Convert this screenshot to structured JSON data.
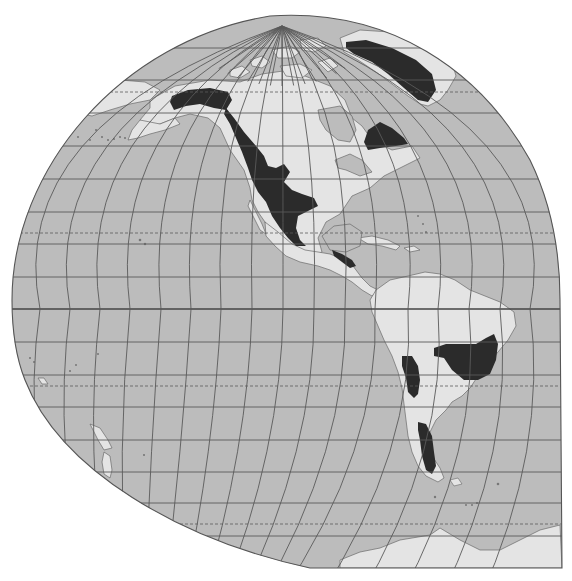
{
  "map": {
    "title": "",
    "projection": "interrupted-globular-western-hemisphere",
    "colors": {
      "background": "#ffffff",
      "ocean": "#bcbcbc",
      "land": "#e4e4e4",
      "highlight_region": "#2b2b2b",
      "grid": "#5a5a5a",
      "outline": "#555555"
    },
    "outline_path": "M 12 300 C 12 170 120 40 270 16 C 390 8 480 70 530 160 C 552 205 560 250 560 300 L 562 568 L 310 568 C 180 540 60 470 25 380 C 15 355 12 330 12 300 Z",
    "parallels": [
      {
        "y": 48,
        "style": "solid"
      },
      {
        "y": 80,
        "style": "solid"
      },
      {
        "y": 92,
        "style": "dashed",
        "label": "arctic-circle"
      },
      {
        "y": 113,
        "style": "solid"
      },
      {
        "y": 146,
        "style": "solid"
      },
      {
        "y": 179,
        "style": "solid"
      },
      {
        "y": 212,
        "style": "solid"
      },
      {
        "y": 233,
        "style": "dashed",
        "label": "tropic-of-cancer"
      },
      {
        "y": 244,
        "style": "solid"
      },
      {
        "y": 277,
        "style": "solid"
      },
      {
        "y": 309,
        "style": "equator"
      },
      {
        "y": 342,
        "style": "solid"
      },
      {
        "y": 375,
        "style": "solid"
      },
      {
        "y": 386,
        "style": "dashed",
        "label": "tropic-of-capricorn"
      },
      {
        "y": 407,
        "style": "solid"
      },
      {
        "y": 440,
        "style": "solid"
      },
      {
        "y": 472,
        "style": "solid"
      },
      {
        "y": 503,
        "style": "solid"
      },
      {
        "y": 524,
        "style": "dashed",
        "label": "antarctic-circle"
      },
      {
        "y": 536,
        "style": "solid"
      }
    ],
    "pole": {
      "x": 282,
      "y": 26
    },
    "south_convergence": {
      "x": 120,
      "y": 720
    },
    "meridian_equator_x": [
      40,
      70,
      100,
      130,
      161,
      191,
      221,
      252,
      283,
      314,
      345,
      375,
      408,
      438,
      469,
      500,
      530
    ],
    "land_shapes": [
      {
        "name": "north-america",
        "points": "150,100 175,86 210,80 240,82 262,74 290,70 310,78 330,86 345,100 352,118 362,126 372,140 392,150 412,146 420,158 400,168 384,176 370,188 352,196 340,214 326,222 318,238 322,252 310,258 298,252 288,246 278,240 270,232 265,222 258,212 252,200 250,188 244,170 230,150 220,128 208,118 190,114 175,118 160,124 148,126 140,120 150,108"
      },
      {
        "name": "alaska-peninsula",
        "points": "140,120 160,124 175,118 180,124 165,130 150,134 138,138 128,140 132,130"
      },
      {
        "name": "chukotka",
        "points": "100,84 120,80 145,82 160,90 150,100 130,104 110,110 92,116 82,114 90,100"
      },
      {
        "name": "central-america",
        "points": "265,222 278,232 292,244 305,250 318,252 330,254 340,258 350,262 356,270 362,278 370,286 378,290 372,296 362,290 352,282 342,276 330,270 318,266 300,262 286,256 275,246 266,236"
      },
      {
        "name": "baja-california",
        "points": "250,200 256,212 262,224 266,234 260,230 254,218 248,206"
      },
      {
        "name": "south-america",
        "points": "376,290 390,280 408,276 425,272 440,274 455,280 470,290 485,296 500,302 514,312 516,326 508,340 498,352 488,364 478,376 470,388 462,396 452,402 446,410 436,420 430,432 428,444 432,456 440,468 444,478 438,482 426,476 418,466 412,452 408,436 406,420 404,404 402,388 398,372 392,356 384,340 378,326 372,312 370,300"
      },
      {
        "name": "greenland",
        "points": "340,38 360,30 390,32 420,40 440,50 452,62 456,76 448,90 440,100 428,106 420,104 408,96 392,84 376,72 358,60 344,52"
      },
      {
        "name": "cuba",
        "points": "358,238 372,236 388,240 400,246 396,250 382,246 368,244"
      },
      {
        "name": "hispaniola",
        "points": "404,248 414,246 420,250 410,252"
      },
      {
        "name": "antarctica",
        "points": "340,560 360,552 380,548 400,540 430,535 440,528 460,540 480,550 500,550 520,540 540,530 560,525 562,568 340,568"
      },
      {
        "name": "new-zealand-north",
        "points": "90,424 100,428 108,440 112,448 104,450 98,440"
      },
      {
        "name": "new-zealand-south",
        "points": "104,452 110,456 112,470 110,478 104,474 102,462"
      },
      {
        "name": "fiji",
        "points": "38,378 44,378 48,384 42,384"
      }
    ],
    "arctic_islands": [
      {
        "points": "250,60 262,56 270,62 262,68 252,66"
      },
      {
        "points": "272,50 290,46 300,52 292,58 278,58"
      },
      {
        "points": "300,40 318,38 326,46 314,52 302,50"
      },
      {
        "points": "280,66 300,64 312,70 302,78 286,76"
      },
      {
        "points": "230,70 242,66 250,72 240,78 230,76"
      },
      {
        "points": "318,62 330,58 338,66 328,72"
      }
    ],
    "inland_water": [
      {
        "name": "hudson-bay",
        "points": "318,110 340,106 352,116 356,130 350,142 338,140 326,130 320,120"
      },
      {
        "name": "gulf-of-mexico",
        "points": "322,236 334,226 350,224 362,232 360,246 346,252 330,250"
      },
      {
        "name": "great-lakes",
        "points": "335,160 350,154 362,160 372,172 360,176 346,170 338,168"
      }
    ],
    "highlight_regions": [
      {
        "name": "alaska-range-region",
        "points": "172,96 188,90 210,88 228,92 232,100 226,110 214,108 200,104 186,106 174,110 170,102"
      },
      {
        "name": "western-cordillera-region",
        "points": "226,108 234,118 244,132 256,146 264,156 268,166 276,168 284,164 290,172 284,182 292,190 302,194 314,198 318,206 306,212 298,216 296,228 300,240 306,246 296,246 288,238 280,228 272,216 266,202 258,192 252,180 248,168 242,152 236,138 230,124 224,114"
      },
      {
        "name": "central-america-region",
        "points": "332,250 342,254 352,260 356,266 350,268 342,262 334,256"
      },
      {
        "name": "greenland-region",
        "points": "346,42 366,40 392,48 416,60 432,74 436,90 428,102 418,100 404,88 388,74 372,62 354,54 346,48"
      },
      {
        "name": "labrador-region",
        "points": "368,130 380,122 392,128 404,138 408,144 396,146 380,148 368,150 364,142"
      },
      {
        "name": "brazil-highlands-region",
        "points": "434,348 446,344 462,344 476,344 486,338 494,334 498,344 496,360 490,374 478,380 464,380 452,370 444,358 434,356"
      },
      {
        "name": "andes-central-region",
        "points": "402,356 412,356 418,366 420,380 418,394 414,398 408,392 406,378 402,366"
      },
      {
        "name": "patagonia-region",
        "points": "418,422 426,424 432,436 434,452 436,466 432,474 426,470 422,456 420,440 418,430"
      }
    ],
    "small_islands": [
      {
        "cx": 96,
        "cy": 130,
        "r": 1.1
      },
      {
        "cx": 102,
        "cy": 137,
        "r": 1.1
      },
      {
        "cx": 108,
        "cy": 140,
        "r": 1.1
      },
      {
        "cx": 114,
        "cy": 139,
        "r": 1.1
      },
      {
        "cx": 120,
        "cy": 137,
        "r": 1.1
      },
      {
        "cx": 125,
        "cy": 138,
        "r": 1.1
      },
      {
        "cx": 78,
        "cy": 137,
        "r": 1.0
      },
      {
        "cx": 90,
        "cy": 140,
        "r": 1.0
      },
      {
        "cx": 140,
        "cy": 240,
        "r": 1.3
      },
      {
        "cx": 145,
        "cy": 244,
        "r": 1.2
      },
      {
        "cx": 30,
        "cy": 358,
        "r": 1.1
      },
      {
        "cx": 34,
        "cy": 362,
        "r": 1.0
      },
      {
        "cx": 70,
        "cy": 371,
        "r": 1.1
      },
      {
        "cx": 76,
        "cy": 365,
        "r": 1.0
      },
      {
        "cx": 98,
        "cy": 354,
        "r": 1.0
      },
      {
        "cx": 144,
        "cy": 455,
        "r": 1.1
      },
      {
        "cx": 498,
        "cy": 484,
        "r": 1.3
      },
      {
        "cx": 472,
        "cy": 505,
        "r": 1.0
      },
      {
        "cx": 477,
        "cy": 503,
        "r": 1.0
      },
      {
        "cx": 466,
        "cy": 505,
        "r": 1.0
      },
      {
        "cx": 435,
        "cy": 497,
        "r": 1.2
      },
      {
        "cx": 418,
        "cy": 216,
        "r": 1.0
      },
      {
        "cx": 423,
        "cy": 224,
        "r": 1.0
      },
      {
        "cx": 426,
        "cy": 232,
        "r": 1.0
      }
    ],
    "falklands": {
      "points": "450,480 458,478 462,484 454,486"
    }
  }
}
